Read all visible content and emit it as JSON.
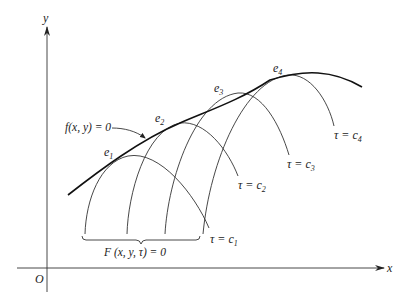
{
  "figure": {
    "axes": {
      "x_label": "x",
      "y_label": "y",
      "origin_label": "O"
    },
    "envelope": {
      "label": "f(x, y) = 0"
    },
    "family": {
      "label": "F (x, y, τ) = 0"
    },
    "tangency_points": [
      {
        "name": "e",
        "sub": "1"
      },
      {
        "name": "e",
        "sub": "2"
      },
      {
        "name": "e",
        "sub": "3"
      },
      {
        "name": "e",
        "sub": "4"
      }
    ],
    "curves": [
      {
        "param": "τ = c",
        "sub": "1"
      },
      {
        "param": "τ = c",
        "sub": "2"
      },
      {
        "param": "τ = c",
        "sub": "3"
      },
      {
        "param": "τ = c",
        "sub": "4"
      }
    ],
    "colors": {
      "ink": "#222222",
      "background": "#ffffff"
    }
  }
}
